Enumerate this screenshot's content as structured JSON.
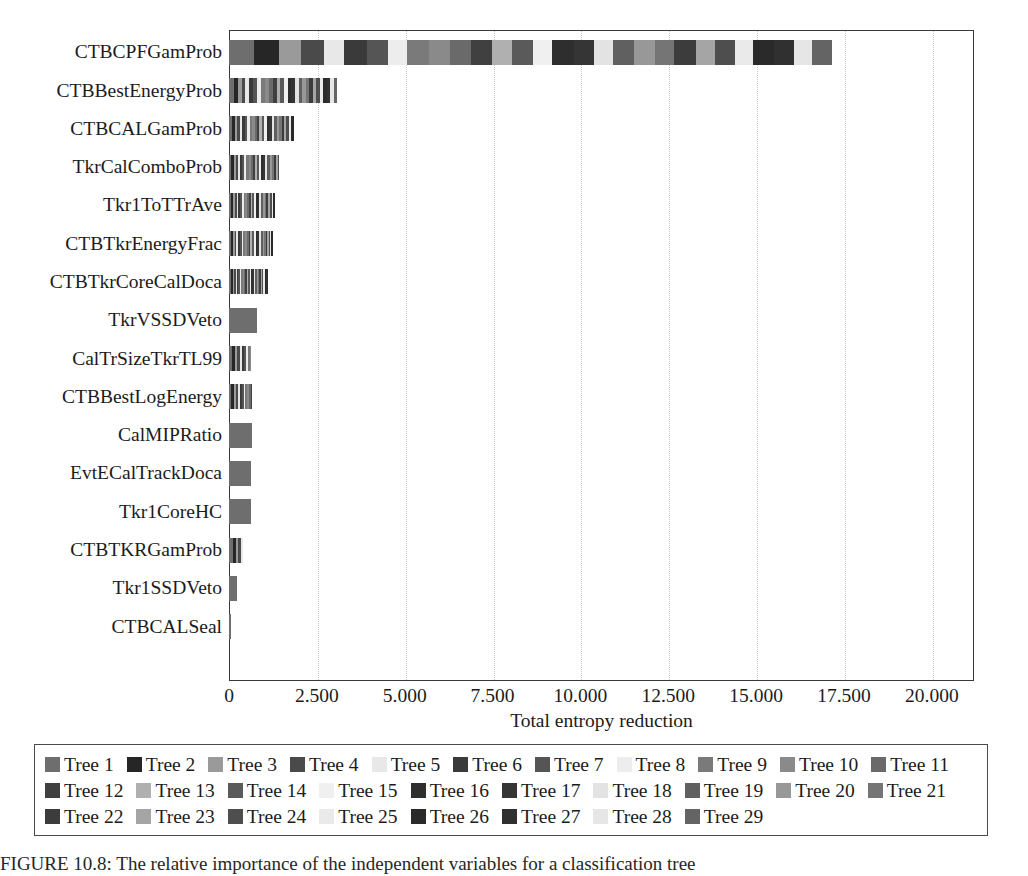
{
  "chart_data": {
    "type": "bar",
    "orientation": "horizontal",
    "stacked": true,
    "title": "",
    "xlabel": "Total entropy reduction",
    "ylabel": "",
    "xlim": [
      0,
      21.2
    ],
    "xticks": [
      0,
      2.5,
      5.0,
      7.5,
      10.0,
      12.5,
      15.0,
      17.5,
      20.0
    ],
    "xticklabels": [
      "0",
      "2.500",
      "5.000",
      "7.500",
      "10.000",
      "12.500",
      "15.000",
      "17.500",
      "20.000"
    ],
    "grid": "vertical-dotted",
    "legend_position": "below-axes",
    "categories": [
      "CTBCPFGamProb",
      "CTBBestEnergyProb",
      "CTBCALGamProb",
      "TkrCalComboProb",
      "Tkr1ToTTrAve",
      "CTBTkrEnergyFrac",
      "CTBTkrCoreCalDoca",
      "TkrVSSDVeto",
      "CalTrSizeTkrTL99",
      "CTBBestLogEnergy",
      "CalMIPRatio",
      "EvtECalTrackDoca",
      "Tkr1CoreHC",
      "CTBTKRGamProb",
      "Tkr1SSDVeto",
      "CTBCALSeal"
    ],
    "totals": [
      17.15,
      3.12,
      1.86,
      1.42,
      1.32,
      1.24,
      1.12,
      0.8,
      0.78,
      0.72,
      0.66,
      0.64,
      0.62,
      0.4,
      0.22,
      0.07
    ],
    "series_names": [
      "Tree 1",
      "Tree 2",
      "Tree 3",
      "Tree 4",
      "Tree 5",
      "Tree 6",
      "Tree 7",
      "Tree 8",
      "Tree 9",
      "Tree 10",
      "Tree 11",
      "Tree 12",
      "Tree 13",
      "Tree 14",
      "Tree 15",
      "Tree 16",
      "Tree 17",
      "Tree 18",
      "Tree 19",
      "Tree 20",
      "Tree 21",
      "Tree 22",
      "Tree 23",
      "Tree 24",
      "Tree 25",
      "Tree 26",
      "Tree 27",
      "Tree 28",
      "Tree 29"
    ],
    "series_colors": [
      "#6e6e6e",
      "#262626",
      "#9a9a9a",
      "#4a4a4a",
      "#e8e8e8",
      "#3a3a3a",
      "#555555",
      "#ededed",
      "#7a7a7a",
      "#8a8a8a",
      "#6a6a6a",
      "#404040",
      "#b0b0b0",
      "#5a5a5a",
      "#f0f0f0",
      "#2e2e2e",
      "#353535",
      "#e3e3e3",
      "#606060",
      "#989898",
      "#757575",
      "#3c3c3c",
      "#a5a5a5",
      "#4e4e4e",
      "#eaeaea",
      "#2a2a2a",
      "#303030",
      "#e6e6e6",
      "#646464"
    ],
    "series": [
      {
        "name": "Tree 1",
        "values": [
          0.7,
          0.14,
          0.09,
          0.07,
          0.06,
          0.06,
          0.05,
          0.8,
          0.09,
          0.07,
          0.66,
          0.64,
          0.62,
          0.1,
          0.22,
          0.07
        ]
      },
      {
        "name": "Tree 2",
        "values": [
          0.72,
          0.12,
          0.08,
          0.07,
          0.06,
          0.05,
          0.05,
          0.0,
          0.08,
          0.07,
          0.0,
          0.0,
          0.0,
          0.09,
          0.0,
          0.0
        ]
      },
      {
        "name": "Tree 3",
        "values": [
          0.62,
          0.1,
          0.07,
          0.06,
          0.05,
          0.05,
          0.05,
          0.0,
          0.07,
          0.06,
          0.0,
          0.0,
          0.0,
          0.08,
          0.0,
          0.0
        ]
      },
      {
        "name": "Tree 4",
        "values": [
          0.66,
          0.11,
          0.07,
          0.06,
          0.05,
          0.05,
          0.04,
          0.0,
          0.07,
          0.06,
          0.0,
          0.0,
          0.0,
          0.07,
          0.0,
          0.0
        ]
      },
      {
        "name": "Tree 5",
        "values": [
          0.58,
          0.1,
          0.07,
          0.06,
          0.05,
          0.05,
          0.04,
          0.0,
          0.06,
          0.06,
          0.0,
          0.0,
          0.0,
          0.06,
          0.0,
          0.0
        ]
      },
      {
        "name": "Tree 6",
        "values": [
          0.64,
          0.11,
          0.07,
          0.06,
          0.05,
          0.05,
          0.04,
          0.0,
          0.06,
          0.05,
          0.0,
          0.0,
          0.0,
          0.0,
          0.0,
          0.0
        ]
      },
      {
        "name": "Tree 7",
        "values": [
          0.6,
          0.12,
          0.07,
          0.06,
          0.05,
          0.05,
          0.04,
          0.0,
          0.06,
          0.05,
          0.0,
          0.0,
          0.0,
          0.0,
          0.0,
          0.0
        ]
      },
      {
        "name": "Tree 8",
        "values": [
          0.56,
          0.11,
          0.07,
          0.06,
          0.05,
          0.05,
          0.04,
          0.0,
          0.05,
          0.05,
          0.0,
          0.0,
          0.0,
          0.0,
          0.0,
          0.0
        ]
      },
      {
        "name": "Tree 9",
        "values": [
          0.62,
          0.12,
          0.07,
          0.06,
          0.05,
          0.05,
          0.04,
          0.0,
          0.05,
          0.05,
          0.0,
          0.0,
          0.0,
          0.0,
          0.0,
          0.0
        ]
      },
      {
        "name": "Tree 10",
        "values": [
          0.58,
          0.11,
          0.07,
          0.06,
          0.05,
          0.05,
          0.04,
          0.0,
          0.05,
          0.05,
          0.0,
          0.0,
          0.0,
          0.0,
          0.0,
          0.0
        ]
      },
      {
        "name": "Tree 11",
        "values": [
          0.6,
          0.11,
          0.07,
          0.06,
          0.05,
          0.05,
          0.04,
          0.0,
          0.0,
          0.05,
          0.0,
          0.0,
          0.0,
          0.0,
          0.0,
          0.0
        ]
      },
      {
        "name": "Tree 12",
        "values": [
          0.62,
          0.11,
          0.07,
          0.06,
          0.05,
          0.05,
          0.04,
          0.0,
          0.0,
          0.05,
          0.0,
          0.0,
          0.0,
          0.0,
          0.0,
          0.0
        ]
      },
      {
        "name": "Tree 13",
        "values": [
          0.56,
          0.1,
          0.07,
          0.06,
          0.05,
          0.05,
          0.04,
          0.0,
          0.0,
          0.0,
          0.0,
          0.0,
          0.0,
          0.0,
          0.0,
          0.0
        ]
      },
      {
        "name": "Tree 14",
        "values": [
          0.6,
          0.11,
          0.07,
          0.06,
          0.05,
          0.05,
          0.04,
          0.0,
          0.0,
          0.0,
          0.0,
          0.0,
          0.0,
          0.0,
          0.0,
          0.0
        ]
      },
      {
        "name": "Tree 15",
        "values": [
          0.54,
          0.1,
          0.07,
          0.06,
          0.05,
          0.05,
          0.04,
          0.0,
          0.0,
          0.0,
          0.0,
          0.0,
          0.0,
          0.0,
          0.0,
          0.0
        ]
      },
      {
        "name": "Tree 16",
        "values": [
          0.62,
          0.11,
          0.07,
          0.06,
          0.05,
          0.05,
          0.04,
          0.0,
          0.0,
          0.0,
          0.0,
          0.0,
          0.0,
          0.0,
          0.0,
          0.0
        ]
      },
      {
        "name": "Tree 17",
        "values": [
          0.58,
          0.11,
          0.07,
          0.06,
          0.05,
          0.05,
          0.04,
          0.0,
          0.0,
          0.0,
          0.0,
          0.0,
          0.0,
          0.0,
          0.0,
          0.0
        ]
      },
      {
        "name": "Tree 18",
        "values": [
          0.54,
          0.1,
          0.07,
          0.06,
          0.05,
          0.05,
          0.04,
          0.0,
          0.0,
          0.0,
          0.0,
          0.0,
          0.0,
          0.0,
          0.0,
          0.0
        ]
      },
      {
        "name": "Tree 19",
        "values": [
          0.6,
          0.1,
          0.07,
          0.06,
          0.05,
          0.05,
          0.04,
          0.0,
          0.0,
          0.0,
          0.0,
          0.0,
          0.0,
          0.0,
          0.0,
          0.0
        ]
      },
      {
        "name": "Tree 20",
        "values": [
          0.58,
          0.1,
          0.07,
          0.06,
          0.05,
          0.05,
          0.04,
          0.0,
          0.0,
          0.0,
          0.0,
          0.0,
          0.0,
          0.0,
          0.0,
          0.0
        ]
      },
      {
        "name": "Tree 21",
        "values": [
          0.56,
          0.1,
          0.07,
          0.06,
          0.05,
          0.04,
          0.04,
          0.0,
          0.0,
          0.0,
          0.0,
          0.0,
          0.0,
          0.0,
          0.0,
          0.0
        ]
      },
      {
        "name": "Tree 22",
        "values": [
          0.6,
          0.1,
          0.07,
          0.06,
          0.05,
          0.04,
          0.04,
          0.0,
          0.0,
          0.0,
          0.0,
          0.0,
          0.0,
          0.0,
          0.0,
          0.0
        ]
      },
      {
        "name": "Tree 23",
        "values": [
          0.54,
          0.1,
          0.07,
          0.06,
          0.05,
          0.04,
          0.04,
          0.0,
          0.0,
          0.0,
          0.0,
          0.0,
          0.0,
          0.0,
          0.0,
          0.0
        ]
      },
      {
        "name": "Tree 24",
        "values": [
          0.58,
          0.1,
          0.07,
          0.06,
          0.05,
          0.04,
          0.04,
          0.0,
          0.0,
          0.0,
          0.0,
          0.0,
          0.0,
          0.0,
          0.0,
          0.0
        ]
      },
      {
        "name": "Tree 25",
        "values": [
          0.52,
          0.1,
          0.07,
          0.06,
          0.05,
          0.04,
          0.04,
          0.0,
          0.0,
          0.0,
          0.0,
          0.0,
          0.0,
          0.0,
          0.0,
          0.0
        ]
      },
      {
        "name": "Tree 26",
        "values": [
          0.6,
          0.1,
          0.07,
          0.06,
          0.05,
          0.04,
          0.04,
          0.0,
          0.0,
          0.0,
          0.0,
          0.0,
          0.0,
          0.0,
          0.0,
          0.0
        ]
      },
      {
        "name": "Tree 27",
        "values": [
          0.56,
          0.1,
          0.07,
          0.06,
          0.05,
          0.04,
          0.04,
          0.0,
          0.0,
          0.0,
          0.0,
          0.0,
          0.0,
          0.0,
          0.0,
          0.0
        ]
      },
      {
        "name": "Tree 28",
        "values": [
          0.52,
          0.1,
          0.07,
          0.06,
          0.05,
          0.04,
          0.04,
          0.0,
          0.0,
          0.0,
          0.0,
          0.0,
          0.0,
          0.0,
          0.0,
          0.0
        ]
      },
      {
        "name": "Tree 29",
        "values": [
          0.6,
          0.1,
          0.07,
          0.06,
          0.05,
          0.04,
          0.04,
          0.0,
          0.0,
          0.0,
          0.0,
          0.0,
          0.0,
          0.0,
          0.0,
          0.0
        ]
      }
    ]
  },
  "legend": {
    "rows": [
      [
        "Tree 1",
        "Tree 2",
        "Tree 3",
        "Tree 4",
        "Tree 5",
        "Tree 6",
        "Tree 7",
        "Tree 8",
        "Tree 9",
        "Tree 10",
        "Tree 11"
      ],
      [
        "Tree 12",
        "Tree 13",
        "Tree 14",
        "Tree 15",
        "Tree 16",
        "Tree 17",
        "Tree 18",
        "Tree 19",
        "Tree 20",
        "Tree 21"
      ],
      [
        "Tree 22",
        "Tree 23",
        "Tree 24",
        "Tree 25",
        "Tree 26",
        "Tree 27",
        "Tree 28",
        "Tree 29"
      ]
    ]
  },
  "caption": {
    "text": "FIGURE 10.8:  The relative importance of the independent variables for a classification tree"
  }
}
